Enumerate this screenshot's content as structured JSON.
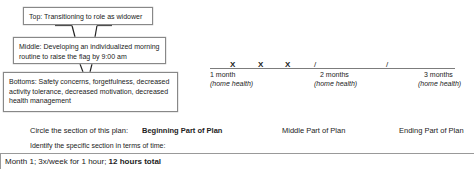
{
  "diagram": {
    "top": "Top: Transitioning to role as widower",
    "middle": "Middle: Developing an individualized morning routine to raise the flag by 9:00 am",
    "bottom": "Bottoms: Safety concerns, forgetfulness, decreased activity tolerance, decreased motivation, decreased health management"
  },
  "timeline": {
    "marks": [
      "X",
      "X",
      "X",
      "/",
      "/"
    ],
    "points": [
      {
        "label": "1 month",
        "sub": "(home health)"
      },
      {
        "label": "2 months",
        "sub": "(home health)"
      },
      {
        "label": "3 months",
        "sub": "(home health)"
      }
    ]
  },
  "section_question": {
    "prompt": "Circle the section of this plan:",
    "options": [
      "Beginning Part of Plan",
      "Middle Part of Plan",
      "Ending Part of Plan"
    ],
    "selected": "Beginning Part of Plan"
  },
  "time_question": {
    "prompt": "Identify the specific section in terms of time:",
    "answer_plain": "Month 1; 3x/week for 1 hour; ",
    "answer_bold": "12 hours total"
  }
}
